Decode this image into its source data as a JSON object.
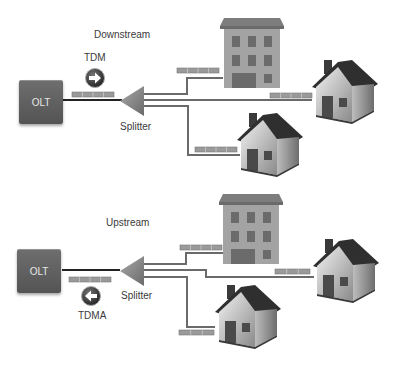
{
  "panels": {
    "downstream": {
      "title": "Downstream",
      "olt_label": "OLT",
      "mode_label": "TDM",
      "direction": "right",
      "splitter_label": "Splitter"
    },
    "upstream": {
      "title": "Upstream",
      "olt_label": "OLT",
      "mode_label": "TDMA",
      "direction": "left",
      "splitter_label": "Splitter"
    }
  },
  "endpoints": [
    "apartment-building",
    "house",
    "house"
  ],
  "colors": {
    "olt": "#5e5e5e",
    "splitter": "#8a8a8a",
    "fiber": "#666666",
    "packet": "#8f8f8f",
    "building": "#9a9a9a",
    "roof": "#333333"
  }
}
